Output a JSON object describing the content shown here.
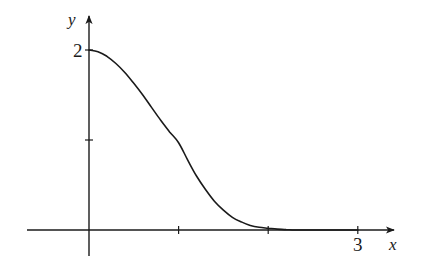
{
  "chart_data": {
    "type": "line",
    "title": "",
    "xlabel": "x",
    "ylabel": "y",
    "x_tick_positions": [
      1,
      2,
      3
    ],
    "x_tick_labels": [
      "",
      "",
      "3"
    ],
    "y_tick_positions": [
      1,
      2
    ],
    "y_tick_labels": [
      "",
      "2"
    ],
    "xlim": [
      -0.7,
      3.5
    ],
    "ylim": [
      -0.3,
      2.35
    ],
    "grid": false,
    "legend": null,
    "series": [
      {
        "name": "f(x)",
        "x": [
          0,
          0.1,
          0.2,
          0.3,
          0.4,
          0.5,
          0.6,
          0.7,
          0.8,
          0.9,
          1.0,
          1.1,
          1.2,
          1.3,
          1.4,
          1.5,
          1.6,
          1.7,
          1.8,
          1.9,
          2.0,
          2.1,
          2.2,
          2.3,
          2.5,
          2.7,
          3.0
        ],
        "y": [
          2.0,
          1.98,
          1.93,
          1.85,
          1.75,
          1.63,
          1.5,
          1.36,
          1.22,
          1.09,
          0.97,
          0.78,
          0.6,
          0.45,
          0.32,
          0.22,
          0.14,
          0.09,
          0.05,
          0.03,
          0.02,
          0.01,
          0.005,
          0.0,
          0.0,
          0.0,
          0.0
        ]
      }
    ]
  },
  "labels": {
    "x_axis": "x",
    "y_axis": "y",
    "y_tick_2": "2",
    "x_tick_3": "3"
  },
  "style": {
    "ink_color": "#1a1a1a",
    "background": "#ffffff"
  }
}
